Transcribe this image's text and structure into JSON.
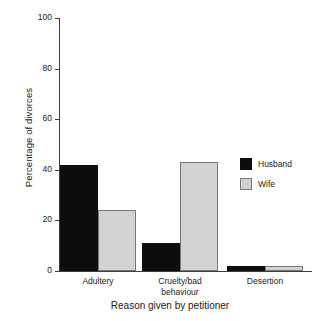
{
  "chart_data": {
    "type": "bar",
    "title": "",
    "subtitle": "",
    "xlabel": "Reason given by petitioner",
    "ylabel": "Percentage of divorces",
    "categories": [
      "Adultery",
      "Cruelty/bad behaviour",
      "Desertion"
    ],
    "category_lines": [
      [
        "Adultery"
      ],
      [
        "Cruelty/bad",
        "behaviour"
      ],
      [
        "Desertion"
      ]
    ],
    "series": [
      {
        "name": "Husband",
        "color": "#0d0d0d",
        "values": [
          42,
          11,
          2
        ]
      },
      {
        "name": "Wife",
        "color": "#d2d2d2",
        "values": [
          24,
          43,
          2
        ]
      }
    ],
    "ylim": [
      0,
      100
    ],
    "yticks": [
      0,
      20,
      40,
      60,
      80,
      100
    ],
    "ytick_labels": [
      "0",
      "20",
      "40",
      "60",
      "80",
      "100"
    ],
    "grid": false,
    "legend_position": "right",
    "legend_entries": [
      "Husband",
      "Wife"
    ],
    "bar_grouping": "grouped-adjacent"
  },
  "axes": {
    "y_title": "Percentage of divorces",
    "x_title": "Reason given by petitioner"
  },
  "legend": {
    "husband_label": "Husband",
    "wife_label": "Wife"
  },
  "colors": {
    "husband": "#0d0d0d",
    "wife": "#d2d2d2",
    "axis": "#3d3d3d",
    "background": "#ffffff"
  }
}
